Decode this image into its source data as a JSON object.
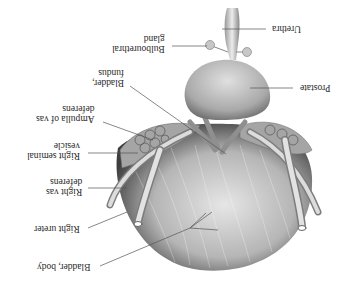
{
  "figure": {
    "orientation": "rotated-180",
    "labels": [
      {
        "id": "urethra",
        "line1": "Urethra",
        "line2": ""
      },
      {
        "id": "bulbourethral-gland",
        "line1": "Bulbourethral",
        "line2": "gland"
      },
      {
        "id": "prostate",
        "line1": "Prostate",
        "line2": ""
      },
      {
        "id": "bladder-fundus",
        "line1": "Bladder,",
        "line2": "fundus"
      },
      {
        "id": "ampulla-vas-deferens",
        "line1": "Ampulla of vas",
        "line2": "deferens"
      },
      {
        "id": "right-seminal-vesicle",
        "line1": "Right seminal",
        "line2": "vesicle"
      },
      {
        "id": "right-vas-deferens",
        "line1": "Right vas",
        "line2": "deferens"
      },
      {
        "id": "right-ureter",
        "line1": "Right ureter",
        "line2": ""
      },
      {
        "id": "bladder-body",
        "line1": "Bladder, body",
        "line2": ""
      }
    ]
  },
  "colors": {
    "background": "#ffffff",
    "label_text": "#2a2a2a",
    "leader_line": "#555555",
    "bladder_dark": "#3a3a3a",
    "bladder_light": "#d8d8d8",
    "prostate": "#bdbdbd"
  }
}
